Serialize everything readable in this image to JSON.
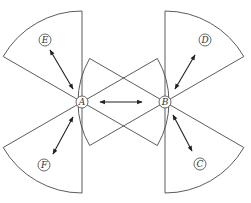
{
  "diagram": {
    "type": "sector-coverage",
    "stroke_color": "#4a4a4a",
    "background": "#ffffff",
    "nodes": [
      {
        "id": "A",
        "label": "A",
        "x": 82,
        "y": 102,
        "role": "station"
      },
      {
        "id": "B",
        "label": "B",
        "x": 165,
        "y": 102,
        "role": "station"
      },
      {
        "id": "C",
        "label": "C",
        "x": 200,
        "y": 164,
        "role": "target"
      },
      {
        "id": "D",
        "label": "D",
        "x": 205,
        "y": 40,
        "role": "target"
      },
      {
        "id": "E",
        "label": "E",
        "x": 45,
        "y": 40,
        "role": "target"
      },
      {
        "id": "F",
        "label": "F",
        "x": 44,
        "y": 165,
        "role": "target"
      }
    ],
    "sectors": [
      {
        "center": "A",
        "start_deg": 210,
        "end_deg": 270,
        "radius": 91,
        "direction": "upper-left"
      },
      {
        "center": "A",
        "start_deg": 90,
        "end_deg": 150,
        "radius": 91,
        "direction": "lower-left"
      },
      {
        "center": "A",
        "start_deg": -30,
        "end_deg": 30,
        "radius": 87,
        "direction": "right"
      },
      {
        "center": "B",
        "start_deg": 270,
        "end_deg": 330,
        "radius": 91,
        "direction": "upper-right"
      },
      {
        "center": "B",
        "start_deg": 30,
        "end_deg": 90,
        "radius": 91,
        "direction": "lower-right"
      },
      {
        "center": "B",
        "start_deg": 150,
        "end_deg": 210,
        "radius": 87,
        "direction": "left"
      }
    ],
    "links": [
      {
        "from": "A",
        "to": "E",
        "x1": 73,
        "y1": 89,
        "x2": 50,
        "y2": 50,
        "bidirectional": true
      },
      {
        "from": "A",
        "to": "F",
        "x1": 73,
        "y1": 117,
        "x2": 53,
        "y2": 154,
        "bidirectional": true
      },
      {
        "from": "A",
        "to": "B",
        "x1": 100,
        "y1": 102,
        "x2": 142,
        "y2": 102,
        "bidirectional": true
      },
      {
        "from": "B",
        "to": "D",
        "x1": 175,
        "y1": 89,
        "x2": 195,
        "y2": 55,
        "bidirectional": true
      },
      {
        "from": "B",
        "to": "C",
        "x1": 173,
        "y1": 115,
        "x2": 192,
        "y2": 151,
        "bidirectional": true
      }
    ]
  }
}
